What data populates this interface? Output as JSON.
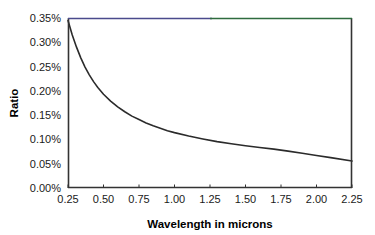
{
  "chart_data": {
    "type": "line",
    "title": "",
    "xlabel": "Wavelength in microns",
    "ylabel": "Ratio",
    "xlim": [
      0.25,
      2.25
    ],
    "ylim": [
      0.0,
      0.35
    ],
    "grid": false,
    "legend": false,
    "y_tick_format": "percent_2dp",
    "xticks": [
      "0.25",
      "0.50",
      "0.75",
      "1.00",
      "1.25",
      "1.50",
      "1.75",
      "2.00",
      "2.25"
    ],
    "xtick_values": [
      0.25,
      0.5,
      0.75,
      1.0,
      1.25,
      1.5,
      1.75,
      2.0,
      2.25
    ],
    "yticks": [
      "0.00%",
      "0.05%",
      "0.10%",
      "0.15%",
      "0.20%",
      "0.25%",
      "0.30%",
      "0.35%"
    ],
    "ytick_values": [
      0.0,
      0.05,
      0.1,
      0.15,
      0.2,
      0.25,
      0.3,
      0.35
    ],
    "series": [
      {
        "name": "Ratio",
        "color": "#2b2b2b",
        "x": [
          0.25,
          0.28,
          0.31,
          0.34,
          0.37,
          0.4,
          0.43,
          0.46,
          0.5,
          0.55,
          0.6,
          0.65,
          0.7,
          0.75,
          0.8,
          0.85,
          0.9,
          0.95,
          1.0,
          1.1,
          1.2,
          1.3,
          1.4,
          1.5,
          1.6,
          1.7,
          1.8,
          1.9,
          2.0,
          2.1,
          2.25
        ],
        "values": [
          0.345,
          0.315,
          0.29,
          0.268,
          0.249,
          0.233,
          0.219,
          0.207,
          0.193,
          0.179,
          0.167,
          0.157,
          0.148,
          0.141,
          0.134,
          0.128,
          0.123,
          0.118,
          0.114,
          0.107,
          0.101,
          0.0955,
          0.091,
          0.087,
          0.0835,
          0.08,
          0.076,
          0.0715,
          0.067,
          0.0625,
          0.0555
        ]
      }
    ]
  },
  "plot_frame": {
    "top_border_left_color": "#4a4a8c",
    "top_border_right_color": "#2e6b3e",
    "axis_color": "#333333",
    "plot_background": "#ffffff"
  }
}
